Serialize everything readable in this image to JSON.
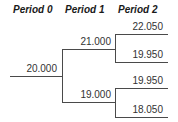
{
  "headers": [
    "Period 0",
    "Period 1",
    "Period 2"
  ],
  "tree": {
    "period0": {
      "value": "20.000"
    },
    "period1": {
      "up": "21.000",
      "down": "19.000"
    },
    "period2": {
      "uu": "22.050",
      "ud": "19.950",
      "du": "19.950",
      "dd": "18.050"
    }
  }
}
